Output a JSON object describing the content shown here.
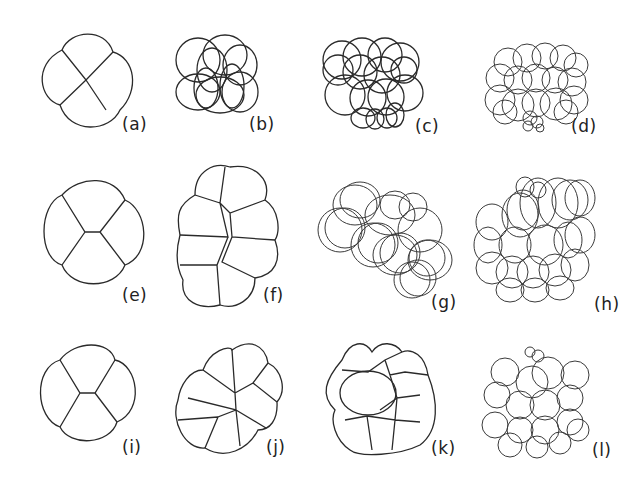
{
  "figure": {
    "panels": [
      {
        "id": "a",
        "label": "(a)",
        "row": 1,
        "col": 1,
        "style": "packed 4-cell, tetrahedral outline"
      },
      {
        "id": "b",
        "label": "(b)",
        "row": 1,
        "col": 2,
        "style": "overlapping circles, 8 cells"
      },
      {
        "id": "c",
        "label": "(c)",
        "row": 1,
        "col": 3,
        "style": "overlapping circles, ~16 cells"
      },
      {
        "id": "d",
        "label": "(d)",
        "row": 1,
        "col": 4,
        "style": "overlapping circles, ~32 cells"
      },
      {
        "id": "e",
        "label": "(e)",
        "row": 2,
        "col": 1,
        "style": "packed 4-cell, planar outline"
      },
      {
        "id": "f",
        "label": "(f)",
        "row": 2,
        "col": 2,
        "style": "packed 8-cell ring"
      },
      {
        "id": "g",
        "label": "(g)",
        "row": 2,
        "col": 3,
        "style": "overlapping circles, loose cluster"
      },
      {
        "id": "h",
        "label": "(h)",
        "row": 2,
        "col": 4,
        "style": "overlapping circles, dense block"
      },
      {
        "id": "i",
        "label": "(i)",
        "row": 3,
        "col": 1,
        "style": "packed 4-cell, planar outline"
      },
      {
        "id": "j",
        "label": "(j)",
        "row": 3,
        "col": 2,
        "style": "packed ~10-cell rosette"
      },
      {
        "id": "k",
        "label": "(k)",
        "row": 3,
        "col": 3,
        "style": "packed polygonal ~20-cell"
      },
      {
        "id": "l",
        "label": "(l)",
        "row": 3,
        "col": 4,
        "style": "overlapping circles, dense cluster"
      }
    ]
  }
}
